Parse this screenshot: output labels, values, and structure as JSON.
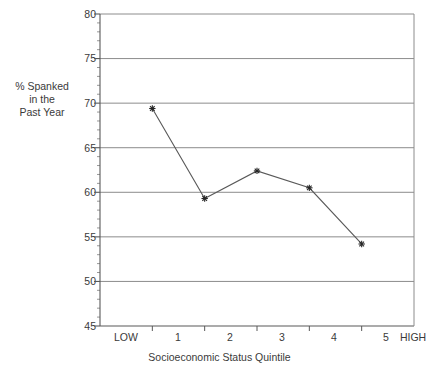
{
  "chart_data": {
    "type": "line",
    "title": "",
    "subtitle": "",
    "xlabel": "Socioeconomic Status Quintile",
    "ylabel": "% Spanked in the Past Year",
    "ylabel_lines": [
      "% Spanked",
      "in the",
      "Past Year"
    ],
    "categories": [
      "1",
      "2",
      "3",
      "4",
      "5"
    ],
    "x_axis_end_labels": {
      "low": "LOW",
      "high": "HIGH"
    },
    "x_tick_labels": [
      "LOW",
      "1",
      "2",
      "3",
      "4",
      "5",
      "HIGH"
    ],
    "values": [
      69.4,
      59.3,
      62.4,
      60.5,
      54.2
    ],
    "series": [
      {
        "name": "% Spanked in the Past Year",
        "values": [
          69.4,
          59.3,
          62.4,
          60.5,
          54.2
        ]
      }
    ],
    "ylim": [
      45,
      80
    ],
    "y_tick_labels": [
      "45",
      "50",
      "55",
      "60",
      "65",
      "70",
      "75",
      "80"
    ],
    "y_tick_values": [
      45,
      50,
      55,
      60,
      65,
      70,
      75,
      80
    ],
    "y_minor_tick_step": 1,
    "grid": "horizontal",
    "legend": "none",
    "marker": "asterisk",
    "colors": {
      "line": "#595959",
      "marker": "#262626",
      "gridline": "#8c8c8c",
      "axis": "#595959",
      "text": "#3a3a3a",
      "background": "#ffffff"
    }
  }
}
